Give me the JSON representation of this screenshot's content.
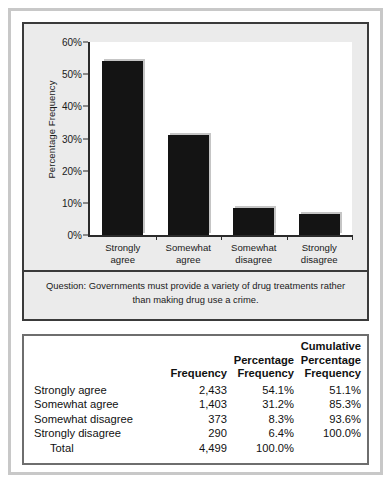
{
  "chart_data": {
    "type": "bar",
    "title": "",
    "xlabel": "",
    "ylabel": "Percentage Frequency",
    "categories": [
      "Strongly\nagree",
      "Somewhat\nagree",
      "Somewhat\ndisagree",
      "Strongly\ndisagree"
    ],
    "values": [
      54.1,
      31.2,
      8.3,
      6.4
    ],
    "ylim": [
      0,
      60
    ],
    "ytick_values": [
      0,
      10,
      20,
      30,
      40,
      50,
      60
    ],
    "ytick_labels": [
      "0%",
      "10%",
      "20%",
      "30%",
      "40%",
      "50%",
      "60%"
    ],
    "grid": false,
    "legend": false,
    "bar_color": "#141414",
    "caption": "Question: Governments must provide a variety of drug treatments rather than making drug use a crime."
  },
  "table": {
    "headers": [
      "",
      "Frequency",
      "Percentage\nFrequency",
      "Cumulative\nPercentage\nFrequency"
    ],
    "rows": [
      {
        "label": "Strongly agree",
        "frequency": "2,433",
        "percentage": "54.1%",
        "cumulative": "51.1%"
      },
      {
        "label": "Somewhat agree",
        "frequency": "1,403",
        "percentage": "31.2%",
        "cumulative": "85.3%"
      },
      {
        "label": "Somewhat disagree",
        "frequency": "373",
        "percentage": "8.3%",
        "cumulative": "93.6%"
      },
      {
        "label": "Strongly disagree",
        "frequency": "290",
        "percentage": "6.4%",
        "cumulative": "100.0%"
      }
    ],
    "total": {
      "label": "Total",
      "frequency": "4,499",
      "percentage": "100.0%",
      "cumulative": ""
    }
  }
}
